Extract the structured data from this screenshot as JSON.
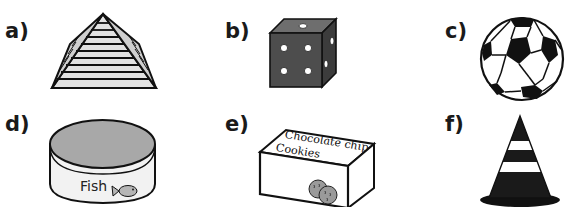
{
  "items": [
    {
      "label": "a)",
      "shape": "pyramid",
      "icon": "pyramid-icon"
    },
    {
      "label": "b)",
      "shape": "cube",
      "icon": "die-icon"
    },
    {
      "label": "c)",
      "shape": "sphere",
      "icon": "soccer-ball-icon"
    },
    {
      "label": "d)",
      "shape": "cylinder",
      "icon": "fish-tin-icon",
      "text": "Fish"
    },
    {
      "label": "e)",
      "shape": "cuboid",
      "icon": "cookie-box-icon",
      "text_line1": "Chocolate chip",
      "text_line2": "Cookies"
    },
    {
      "label": "f)",
      "shape": "cone",
      "icon": "traffic-cone-icon"
    }
  ],
  "colors": {
    "ink": "#111111",
    "light_gray": "#d9d9d9",
    "mid_gray": "#a8a8a8",
    "dark_gray": "#4a4a4a",
    "paper": "#ffffff"
  }
}
